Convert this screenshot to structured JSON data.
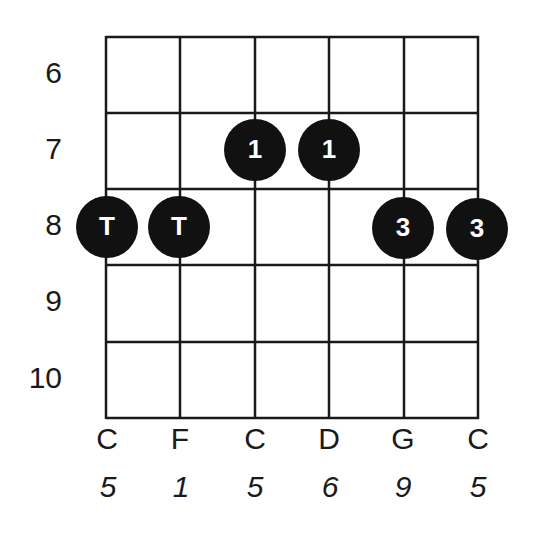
{
  "diagram": {
    "type": "guitar-chord-fretboard",
    "colors": {
      "line": "#1a1a1a",
      "dot": "#111111",
      "dot_text": "#ffffff",
      "background": "#ffffff"
    },
    "fret_labels": [
      "6",
      "7",
      "8",
      "9",
      "10"
    ],
    "strings": [
      {
        "note": "C",
        "interval": "5"
      },
      {
        "note": "F",
        "interval": "1"
      },
      {
        "note": "C",
        "interval": "5"
      },
      {
        "note": "D",
        "interval": "6"
      },
      {
        "note": "G",
        "interval": "9"
      },
      {
        "note": "C",
        "interval": "5"
      }
    ],
    "dots": [
      {
        "string": 0,
        "fret_row": 2,
        "finger": "T"
      },
      {
        "string": 1,
        "fret_row": 2,
        "finger": "T"
      },
      {
        "string": 2,
        "fret_row": 1,
        "finger": "1"
      },
      {
        "string": 3,
        "fret_row": 1,
        "finger": "1"
      },
      {
        "string": 4,
        "fret_row": 2,
        "finger": "3"
      },
      {
        "string": 5,
        "fret_row": 2,
        "finger": "3"
      }
    ]
  }
}
